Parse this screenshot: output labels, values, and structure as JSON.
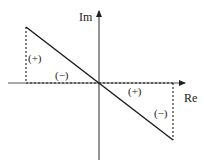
{
  "diagram": {
    "type": "complex-plane-sign-diagram",
    "axes": {
      "x_label": "Re",
      "y_label": "Im",
      "origin": [
        99,
        83
      ]
    },
    "line": {
      "from": [
        26,
        27
      ],
      "to": [
        173,
        140
      ],
      "color": "#1a1a1a"
    },
    "regions": [
      {
        "id": "upper-left-vertical",
        "sign": "(+)"
      },
      {
        "id": "upper-left-horizontal",
        "sign": "(−)"
      },
      {
        "id": "lower-right-horizontal",
        "sign": "(+)"
      },
      {
        "id": "lower-right-vertical",
        "sign": "(−)"
      }
    ],
    "colors": {
      "axis": "#555555",
      "line": "#1a1a1a",
      "dashed": "#1a1a1a",
      "background": "#ffffff"
    }
  }
}
